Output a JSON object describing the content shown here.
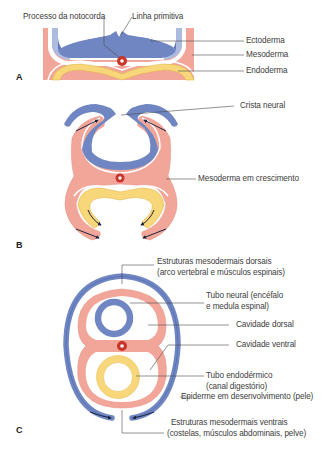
{
  "colors": {
    "ectoderm": "#6f86c2",
    "ectoderm_light": "#aebbe0",
    "ectoderm_dark": "#4d66ad",
    "mesoderm": "#f2a69a",
    "mesoderm_outline": "#e48a7d",
    "endoderm": "#f7d77a",
    "endoderm_outline": "#e2b84a",
    "notochord": "#c8352a",
    "leader_line": "#4a4a4a",
    "arrow": "#1c2440"
  },
  "panels": {
    "A": {
      "letter": "A",
      "labels": {
        "notochord_process": "Processo da notocorda",
        "primitive_streak": "Linha primitiva",
        "ectoderm": "Ectoderma",
        "mesoderm": "Mesoderma",
        "endoderm": "Endoderma"
      }
    },
    "B": {
      "letter": "B",
      "labels": {
        "neural_crest": "Crista neural",
        "growing_mesoderm": "Mesoderma em crescimento"
      }
    },
    "C": {
      "letter": "C",
      "labels": {
        "dorsal_mesoderm_1": "Estruturas mesodermais dorsais",
        "dorsal_mesoderm_2": "(arco vertebral e músculos espinais)",
        "neural_tube_1": "Tubo neural (encéfalo",
        "neural_tube_2": "e medula espinal)",
        "dorsal_cavity": "Cavidade dorsal",
        "ventral_cavity": "Cavidade ventral",
        "endodermal_tube_1": "Tubo endodérmico",
        "endodermal_tube_2": "(canal digestório)",
        "epidermis": "Epiderme em desenvolvimento (pele)",
        "ventral_mesoderm_1": "Estruturas mesodermais ventrais",
        "ventral_mesoderm_2": "(costelas, músculos abdominais, pelve)"
      }
    }
  }
}
